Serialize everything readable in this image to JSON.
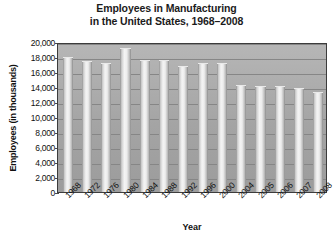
{
  "chart_data": {
    "type": "bar",
    "title": "Employees in Manufacturing in the United States, 1968–2008",
    "title_lines": [
      "Employees in Manufacturing",
      "in the United States, 1968–2008"
    ],
    "xlabel": "Year",
    "ylabel": "Employees (in thousands)",
    "categories": [
      "1968",
      "1972",
      "1976",
      "1980",
      "1984",
      "1988",
      "1992",
      "1996",
      "2000",
      "2004",
      "2005",
      "2006",
      "2007",
      "2008"
    ],
    "values": [
      18000,
      17500,
      17200,
      19200,
      17600,
      17600,
      16800,
      17200,
      17200,
      14300,
      14200,
      14200,
      13900,
      13400
    ],
    "ylim": [
      0,
      20000
    ],
    "ytick_step": 2000,
    "ytick_labels": [
      "20,000",
      "18,000",
      "16,000",
      "14,000",
      "12,000",
      "10,000",
      "8,000",
      "6,000",
      "4,000",
      "2,000",
      "0"
    ],
    "ytick_values": [
      20000,
      18000,
      16000,
      14000,
      12000,
      10000,
      8000,
      6000,
      4000,
      2000,
      0
    ],
    "grid": true,
    "legend": "none",
    "series_name": "Employees in manufacturing",
    "colors": {
      "plot_background": "#a9a9a9",
      "bar_fill": "#ededed",
      "gridline": "#868686",
      "axis": "#3c3c3c",
      "text": "#111111",
      "page_background": "#ffffff"
    }
  }
}
